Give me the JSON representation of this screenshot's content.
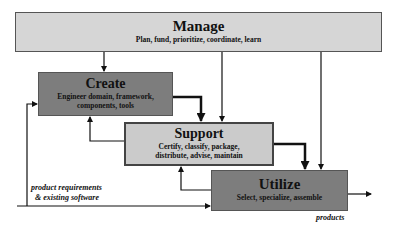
{
  "diagram": {
    "nodes": [
      {
        "id": "manage",
        "title": "Manage",
        "subtitle": "Plan, fund, prioritize, coordinate, learn",
        "fill": "#d6d6d6"
      },
      {
        "id": "create",
        "title": "Create",
        "subtitle_lines": [
          "Engineer domain, framework,",
          "components, tools"
        ],
        "fill": "#7d7d7d"
      },
      {
        "id": "support",
        "title": "Support",
        "subtitle_lines": [
          "Certify, classify, package,",
          "distribute, advise, maintain"
        ],
        "fill": "#cbcbcb"
      },
      {
        "id": "utilize",
        "title": "Utilize",
        "subtitle": "Select, specialize, assemble",
        "fill": "#7d7d7d"
      }
    ],
    "labels": {
      "input_line1": "product requirements",
      "input_line2": "& existing software",
      "output": "products"
    },
    "edges": [
      {
        "from": "manage",
        "to": "create"
      },
      {
        "from": "manage",
        "to": "support"
      },
      {
        "from": "manage",
        "to": "utilize"
      },
      {
        "from": "create",
        "to": "support",
        "style": "thick"
      },
      {
        "from": "support",
        "to": "utilize",
        "style": "thick"
      },
      {
        "from": "support",
        "to": "create"
      },
      {
        "from": "utilize",
        "to": "support"
      },
      {
        "from": "input",
        "to": "create"
      },
      {
        "from": "input",
        "to": "utilize"
      },
      {
        "from": "utilize",
        "to": "output"
      }
    ]
  }
}
